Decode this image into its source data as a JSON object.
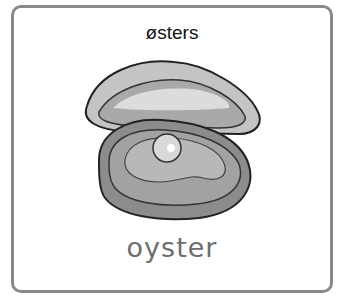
{
  "card": {
    "title": "østers",
    "word": "oyster",
    "image": "oyster-icon",
    "colors": {
      "border": "#8a8a8a",
      "title_text": "#111111",
      "word_text": "#6e6e6e"
    }
  }
}
